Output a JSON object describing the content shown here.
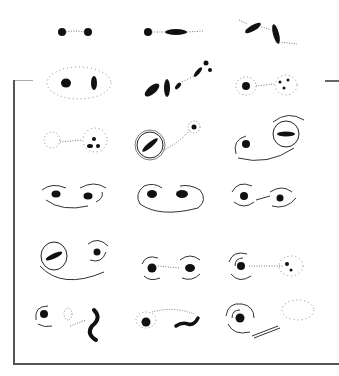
{
  "figure": {
    "colors": {
      "ink": "#111111",
      "frame": "#555555",
      "background": "#ffffff"
    },
    "panels": [
      {
        "row": 1,
        "col": 1,
        "type": "two-cores-bridge"
      },
      {
        "row": 1,
        "col": 2,
        "type": "core-and-bar"
      },
      {
        "row": 1,
        "col": 3,
        "type": "two-tilted-bars"
      },
      {
        "row": 2,
        "col": 1,
        "type": "cores-in-halo"
      },
      {
        "row": 2,
        "col": 2,
        "type": "fragmented-bars"
      },
      {
        "row": 2,
        "col": 3,
        "type": "core-and-debris"
      },
      {
        "row": 3,
        "col": 1,
        "type": "dispersed-pair"
      },
      {
        "row": 3,
        "col": 2,
        "type": "ringed-bar-with-companion"
      },
      {
        "row": 3,
        "col": 3,
        "type": "ring-and-core-with-arm"
      },
      {
        "row": 4,
        "col": 1,
        "type": "spiral-pair"
      },
      {
        "row": 4,
        "col": 2,
        "type": "looped-pair"
      },
      {
        "row": 4,
        "col": 3,
        "type": "spiral-pair-bridge"
      },
      {
        "row": 5,
        "col": 1,
        "type": "ringed-bar-and-spiral"
      },
      {
        "row": 5,
        "col": 2,
        "type": "twin-spirals"
      },
      {
        "row": 5,
        "col": 3,
        "type": "spiral-and-debris"
      },
      {
        "row": 6,
        "col": 1,
        "type": "spiral-loop-s-shape"
      },
      {
        "row": 6,
        "col": 2,
        "type": "core-and-s-bar"
      },
      {
        "row": 6,
        "col": 3,
        "type": "grand-spiral-with-tail"
      }
    ]
  }
}
